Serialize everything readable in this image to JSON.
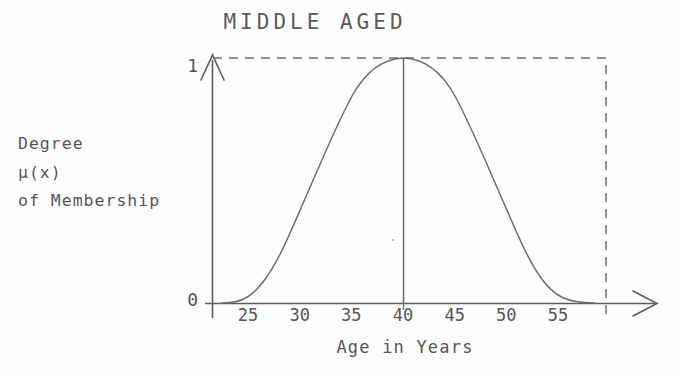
{
  "chart_data": {
    "type": "line",
    "title": "MIDDLE AGED",
    "xlabel": "Age in Years",
    "ylabel": "Degree of Membership μ(x)",
    "ylabel_lines": [
      "Degree",
      "of Membership"
    ],
    "ylabel_symbol": "μ(x)",
    "xlim": [
      22,
      58
    ],
    "ylim": [
      0,
      1
    ],
    "x_ticks": [
      25,
      30,
      35,
      40,
      45,
      50,
      55
    ],
    "x_tick_labels": [
      "25",
      "30",
      "35",
      "40",
      "45",
      "50",
      "55"
    ],
    "y_ticks": [
      0,
      1
    ],
    "y_tick_labels": [
      "0",
      "1"
    ],
    "grid": false,
    "legend": false,
    "series": [
      {
        "name": "middle-aged membership μ(x)",
        "style": "solid",
        "x": [
          22.0,
          23.0,
          24.0,
          25.0,
          26.0,
          27.0,
          28.0,
          29.0,
          30.0,
          31.0,
          32.0,
          33.0,
          34.0,
          35.0,
          36.0,
          37.0,
          38.0,
          39.0,
          40.0,
          41.0,
          42.0,
          43.0,
          44.0,
          45.0,
          46.0,
          47.0,
          48.0,
          49.0,
          50.0,
          51.0,
          52.0,
          53.0,
          54.0,
          55.0,
          56.0,
          57.0,
          58.0
        ],
        "values": [
          0.0,
          0.01,
          0.02,
          0.04,
          0.07,
          0.11,
          0.17,
          0.24,
          0.33,
          0.43,
          0.53,
          0.64,
          0.74,
          0.83,
          0.91,
          0.96,
          0.99,
          1.0,
          1.0,
          1.0,
          0.99,
          0.96,
          0.91,
          0.84,
          0.75,
          0.65,
          0.55,
          0.45,
          0.35,
          0.26,
          0.18,
          0.12,
          0.07,
          0.03,
          0.01,
          0.0,
          0.0
        ]
      }
    ],
    "annotations": [
      {
        "name": "peak-vertical-line",
        "type": "vertical-line",
        "x": 40,
        "y_from": 0,
        "y_to": 1,
        "style": "solid"
      },
      {
        "name": "unity-dashed-guide",
        "type": "dashed-bracket",
        "y": 1,
        "x_from": 22,
        "x_to": 58,
        "style": "dashed"
      }
    ],
    "colors": {
      "background": "#fdfdfd",
      "axis": "#555555",
      "curve": "#6b6b6b",
      "dashed_guide": "#6b6b6b",
      "text": "#555555"
    }
  },
  "chart": {
    "title": "MIDDLE AGED",
    "y_axis": {
      "label_line_1": "Degree",
      "label_line_2": "of Membership",
      "label_symbol": "μ(x)",
      "tick_top": "1",
      "tick_bottom": "0"
    },
    "x_axis": {
      "caption": "Age in Years",
      "ticks": [
        "25",
        "30",
        "35",
        "40",
        "45",
        "50",
        "55"
      ]
    }
  }
}
